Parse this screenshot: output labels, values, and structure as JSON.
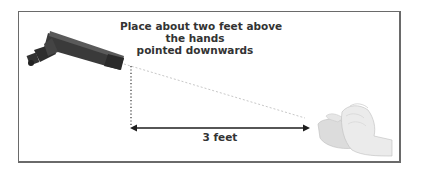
{
  "diagram": {
    "caption_lines": [
      "Place about two feet above",
      "the hands",
      "pointed downwards"
    ],
    "distance_label": "3 feet",
    "elements": {
      "device": "handheld-uv-lamp",
      "target": "pair-of-hands",
      "vertical_line": "dotted",
      "diagonal_line": "dotted-light",
      "horizontal_arrow": "double-headed"
    },
    "colors": {
      "frame": "#6a6a6a",
      "text": "#333333",
      "device": "#3a3a3a",
      "hands": "#e2e2e2",
      "arrow": "#1e1e1e"
    }
  }
}
